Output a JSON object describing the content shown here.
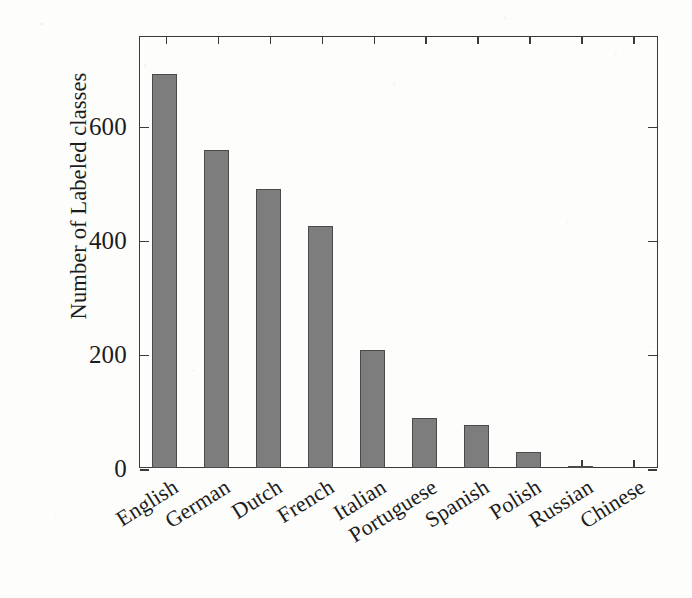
{
  "chart_data": {
    "type": "bar",
    "title": "",
    "xlabel": "",
    "ylabel": "Number of Labeled classes",
    "categories": [
      "English",
      "German",
      "Dutch",
      "French",
      "Italian",
      "Portuguese",
      "Spanish",
      "Polish",
      "Russian",
      "Chinese"
    ],
    "values": [
      690,
      557,
      489,
      424,
      207,
      88,
      75,
      28,
      3,
      0
    ],
    "ylim": [
      0,
      757
    ],
    "ytick_values": [
      0,
      200,
      400,
      600
    ],
    "ytick_labels": [
      "0",
      "200",
      "400",
      "600"
    ],
    "grid": false,
    "legend": null,
    "bar_color": "#7d7d7d",
    "bar_edge_color": "#4a4a4a",
    "axis_color": "#3a3a3a",
    "background_color": "#fdfdfc",
    "xtick_rotation_degrees": -32,
    "frame": "full-box",
    "tick_direction": "in"
  }
}
